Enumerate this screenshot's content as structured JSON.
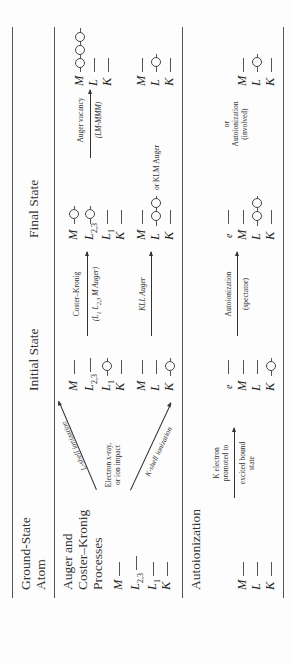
{
  "headers": {
    "ground_state": [
      "Ground-State",
      "Atom"
    ],
    "initial_state": "Initial State",
    "final_state": "Final State"
  },
  "sections": {
    "auger": {
      "title": [
        "Auger and",
        "Coster–Kronig",
        "Processes"
      ],
      "ground_levels": [
        "M",
        "L2,3",
        "L1",
        "K"
      ],
      "excitation_label": [
        "Electron x-ray,",
        "or ion impact"
      ],
      "l_shell_arrow": "L-shell ionization",
      "k_shell_arrow": "K-shell ionization",
      "initial_L": {
        "levels": [
          "M",
          "L2,3",
          "L1",
          "K"
        ],
        "vacancy": "L1"
      },
      "initial_K": {
        "levels": [
          "M",
          "L",
          "K"
        ],
        "vacancy": "K"
      },
      "coster_kronig": {
        "label": "Coster–Kronig",
        "sub": "(L1 L2,3 M Auger)"
      },
      "kll": {
        "label": "KLL Auger"
      },
      "final_ck": {
        "levels": [
          "M",
          "L2,3",
          "L1",
          "K"
        ],
        "vacancies": [
          "M",
          "L2,3"
        ]
      },
      "final_kll": {
        "levels": [
          "M",
          "L",
          "K"
        ],
        "vacancies": [
          "L",
          "L"
        ],
        "or_label": "or KLM Auger"
      },
      "auger_vacancy": {
        "label": "Auger vacancy",
        "sub": "(LM-MMM)"
      },
      "final_lmm": {
        "levels": [
          "M",
          "L",
          "K"
        ],
        "vacancies": [
          "M",
          "M",
          "M"
        ]
      },
      "final_klm": {
        "levels": [
          "M",
          "L",
          "K"
        ],
        "vacancies": [
          "L"
        ]
      }
    },
    "autoionization": {
      "title": "Autoionization",
      "ground_levels": [
        "M",
        "L",
        "K"
      ],
      "promote_label": [
        "K electron",
        "promoted to"
      ],
      "promote_sub": [
        "excited bound",
        "state"
      ],
      "initial": {
        "levels": [
          "e",
          "M",
          "L",
          "K"
        ],
        "vacancy": "K"
      },
      "spectator": {
        "label": "Autoionization",
        "sub": "(spectator)"
      },
      "final_spectator": {
        "levels": [
          "e",
          "M",
          "L",
          "K"
        ],
        "vacancies": [
          "L",
          "L"
        ]
      },
      "involved": {
        "or": "or",
        "label": "Autoionization",
        "sub": "(involved)"
      },
      "final_involved": {
        "levels": [
          "M",
          "L",
          "K"
        ],
        "vacancies": [
          "L"
        ]
      }
    }
  }
}
